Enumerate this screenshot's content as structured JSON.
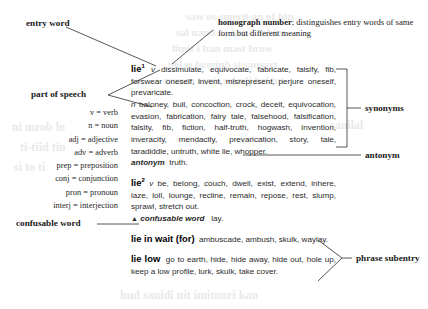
{
  "diagram": {
    "callouts": [
      {
        "id": "entry-word",
        "text": "entry word"
      },
      {
        "id": "homograph-number",
        "bold": "homograph number",
        "rest": "; distinguishes entry words of same form but different meaning"
      },
      {
        "id": "part-of-speech",
        "text": "part of speech"
      },
      {
        "id": "confusable-word",
        "text": "confusable word"
      },
      {
        "id": "synonyms",
        "text": "synonyms"
      },
      {
        "id": "antonym",
        "text": "antonym"
      },
      {
        "id": "phrase-subentry",
        "text": "phrase subentry"
      }
    ],
    "abbreviations": [
      "v = verb",
      "n = noun",
      "adj = adjective",
      "adv = adverb",
      "prep = preposition",
      "conj = conjunction",
      "pron = pronoun",
      "interj = interjection"
    ]
  },
  "entry": {
    "headword_1": "lie",
    "homograph_1": "1",
    "sense_1_pos": "v",
    "sense_1_synonyms": "dissimulate, equivocate, fabricate, falsify, fib, forswear oneself, invent, misrepresent, perjure oneself, prevaricate.",
    "sense_2_pos": "n",
    "sense_2_synonyms": "baloney, bull, concoction, crock, deceit, equivocation, evasion, fabrication, fairy tale, falsehood, falsification, falsity, fib, fiction, half-truth, hogwash, invention, inveracity, mendacity, prevarication, story, tale, taradiddle, untruth, white lie, whopper.",
    "antonym_label": "antonym",
    "antonym_value": "truth.",
    "headword_2": "lie",
    "homograph_2": "2",
    "sense_3_pos": "v",
    "sense_3_synonyms": "be, belong, couch, dwell, exist, extend, inhere, laze, loll, lounge, recline, remain, repose, rest, slump, sprawl, stretch out.",
    "confusable_marker": "▲",
    "confusable_label": "confusable word",
    "confusable_value": "lay.",
    "phrase_1": "lie in wait (for)",
    "phrase_1_synonyms": "ambuscade, ambush, skulk, waylay.",
    "phrase_2": "lie low",
    "phrase_2_synonyms": "go to earth, hide, hide away, hide out, hole up, keep a low profile, lurk, skulk, take cover."
  },
  "ghost_text": [
    "saw os smerit an of hits",
    "sal nand as hand sabim",
    "limit i ban mast brow",
    "uolas heminb si sansart",
    "rozous tanis soindj bri tot",
    "ni  mrob lo",
    "ti-tiid tin",
    "si  to ti",
    "sanilal",
    "hud sanidi nit imitnori kan"
  ]
}
